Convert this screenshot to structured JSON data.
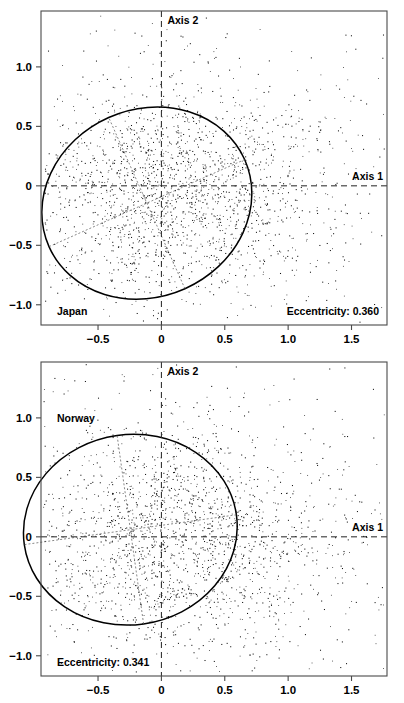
{
  "figure": {
    "type": "scatter-panels",
    "panel_count": 2,
    "background": "#ffffff",
    "point_color": "#121212",
    "ellipse_color": "#000000",
    "frame_color": "#4a4a4a"
  },
  "chart_data": [
    {
      "type": "scatter",
      "title": "",
      "label": "Japan",
      "annotation": "Eccentricity: 0.360",
      "eccentricity": 0.36,
      "xlabel": "",
      "ylabel": "",
      "axis1_label": "Axis 1",
      "axis2_label": "Axis 2",
      "xlim": [
        -0.95,
        1.78
      ],
      "ylim": [
        -1.17,
        1.47
      ],
      "xticks": [
        -0.5,
        0,
        0.5,
        1.0,
        1.5
      ],
      "xticklabels": [
        "−0.5",
        "0",
        "0.5",
        "1.0",
        "1.5"
      ],
      "yticks": [
        -1.0,
        -0.5,
        0,
        0.5,
        1.0
      ],
      "yticklabels": [
        "−1.0",
        "−0.5",
        "0",
        "0.5",
        "1.0"
      ],
      "grid": false,
      "legend": "none",
      "reference_lines": [
        {
          "name": "Axis 1",
          "orientation": "horizontal",
          "value": 0,
          "style": "dashed"
        },
        {
          "name": "Axis 2",
          "orientation": "vertical",
          "value": 0,
          "style": "dashed"
        }
      ],
      "ellipse": {
        "center_x": -0.115,
        "center_y": -0.145,
        "semi_major": 0.845,
        "semi_minor": 0.788,
        "rotation_deg": 24,
        "inner_axes": "dotted"
      },
      "n_points": 2200,
      "cloud": {
        "center_x": 0.1,
        "center_y": -0.05,
        "spread_x": 0.52,
        "spread_y": 0.45
      }
    },
    {
      "type": "scatter",
      "title": "",
      "label": "Norway",
      "annotation": "Eccentricity: 0.341",
      "eccentricity": 0.341,
      "xlabel": "",
      "ylabel": "",
      "axis1_label": "Axis 1",
      "axis2_label": "Axis 2",
      "xlim": [
        -0.95,
        1.78
      ],
      "ylim": [
        -1.17,
        1.47
      ],
      "xticks": [
        -0.5,
        0,
        0.5,
        1.0,
        1.5
      ],
      "xticklabels": [
        "−0.5",
        "0",
        "0.5",
        "1.0",
        "1.5"
      ],
      "yticks": [
        -1.0,
        -0.5,
        0,
        0.5,
        1.0
      ],
      "yticklabels": [
        "−1.0",
        "−0.5",
        "0",
        "0.5",
        "1.0"
      ],
      "grid": false,
      "legend": "none",
      "reference_lines": [
        {
          "name": "Axis 1",
          "orientation": "horizontal",
          "value": 0,
          "style": "dashed"
        },
        {
          "name": "Axis 2",
          "orientation": "vertical",
          "value": 0,
          "style": "dashed"
        }
      ],
      "ellipse": {
        "center_x": -0.245,
        "center_y": 0.06,
        "semi_major": 0.845,
        "semi_minor": 0.8,
        "rotation_deg": 8,
        "inner_axes": "dotted"
      },
      "n_points": 2200,
      "cloud": {
        "center_x": 0.12,
        "center_y": -0.02,
        "spread_x": 0.54,
        "spread_y": 0.46
      }
    }
  ]
}
